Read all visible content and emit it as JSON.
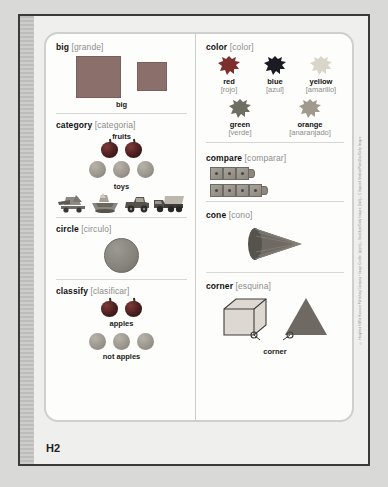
{
  "page": {
    "label": "H2",
    "credit": "© Houghton Mifflin Harcourt Publishing Company • Image Credits: (apple) ©Stockbyte/Getty Images; (ball) ©C Squared Studios/PhotoDisc/Getty Images"
  },
  "sections": {
    "big": {
      "term": "big",
      "translation": "[grande]",
      "caption": "big"
    },
    "category": {
      "term": "category",
      "translation": "[categoria]",
      "group_one": "fruits",
      "group_two": "toys",
      "fruits": {
        "apples": 2,
        "oranges": 3
      },
      "toys": [
        "airplane-toy",
        "boat-toy",
        "car-toy",
        "dump-truck-toy"
      ]
    },
    "circle": {
      "term": "circle",
      "translation": "[circulo]"
    },
    "classify": {
      "term": "classify",
      "translation": "[clasificar]",
      "group_one": "apples",
      "group_two": "not apples",
      "apples": 2,
      "not_apples": 3
    },
    "color": {
      "term": "color",
      "translation": "[color]",
      "swatches": [
        {
          "name": "red",
          "translation": "[rojo]",
          "hex": "#7d2f2c"
        },
        {
          "name": "blue",
          "translation": "[azul]",
          "hex": "#1b1b24"
        },
        {
          "name": "yellow",
          "translation": "[amarillo]",
          "hex": "#d8d6c8"
        },
        {
          "name": "green",
          "translation": "[verde]",
          "hex": "#6e6e63"
        },
        {
          "name": "orange",
          "translation": "[anaranjado]",
          "hex": "#a09a8e"
        }
      ]
    },
    "compare": {
      "term": "compare",
      "translation": "[comparar]",
      "top_row_cubes": 3,
      "bottom_row_cubes": 4
    },
    "cone": {
      "term": "cone",
      "translation": "[cono]"
    },
    "corner": {
      "term": "corner",
      "translation": "[esquina]",
      "caption": "corner"
    }
  }
}
